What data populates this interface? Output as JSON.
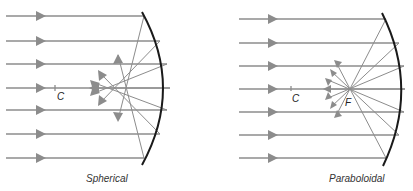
{
  "diagram": {
    "panels": [
      {
        "id": "spherical",
        "caption": "Spherical",
        "center_label": "C",
        "ray_count": 7,
        "colors": {
          "rays": "#8c8c8c",
          "mirror": "#1a1a1a"
        }
      },
      {
        "id": "paraboloidal",
        "caption": "Paraboloidal",
        "center_label": "C",
        "focus_label": "F",
        "ray_count": 7,
        "colors": {
          "rays": "#8c8c8c",
          "mirror": "#1a1a1a"
        }
      }
    ]
  }
}
